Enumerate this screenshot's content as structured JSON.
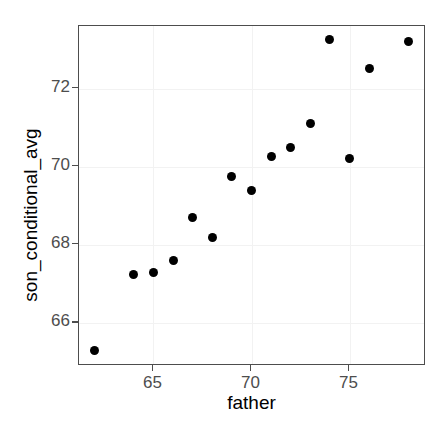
{
  "chart_data": {
    "type": "scatter",
    "title": "",
    "xlabel": "father",
    "ylabel": "son_conditional_avg",
    "xlim": [
      61.2,
      78.9
    ],
    "ylim": [
      64.9,
      73.6
    ],
    "grid": true,
    "legend": null,
    "x_ticks": [
      65,
      70,
      75
    ],
    "y_ticks": [
      66,
      68,
      70,
      72
    ],
    "x_tick_labels": [
      "65",
      "70",
      "75"
    ],
    "y_tick_labels": [
      "66",
      "68",
      "70",
      "72"
    ],
    "point_color": "#000000",
    "panel_border_color": "#4d4d4d",
    "grid_color": "#f2f2f2",
    "background_color": "#ffffff",
    "x": [
      62,
      64,
      65,
      66,
      67,
      68,
      69,
      70,
      71,
      72,
      73,
      74,
      75,
      76,
      78
    ],
    "y": [
      65.3,
      67.25,
      67.3,
      67.6,
      68.7,
      68.2,
      69.75,
      69.4,
      70.25,
      70.5,
      71.1,
      73.25,
      70.2,
      72.5,
      73.2
    ],
    "points": [
      {
        "x": 62,
        "y": 65.3
      },
      {
        "x": 64,
        "y": 67.25
      },
      {
        "x": 65,
        "y": 67.3
      },
      {
        "x": 66,
        "y": 67.6
      },
      {
        "x": 67,
        "y": 68.7
      },
      {
        "x": 68,
        "y": 68.2
      },
      {
        "x": 69,
        "y": 69.75
      },
      {
        "x": 70,
        "y": 69.4
      },
      {
        "x": 71,
        "y": 70.25
      },
      {
        "x": 72,
        "y": 70.5
      },
      {
        "x": 73,
        "y": 71.1
      },
      {
        "x": 74,
        "y": 73.25
      },
      {
        "x": 75,
        "y": 70.2
      },
      {
        "x": 76,
        "y": 72.5
      },
      {
        "x": 78,
        "y": 73.2
      }
    ]
  }
}
